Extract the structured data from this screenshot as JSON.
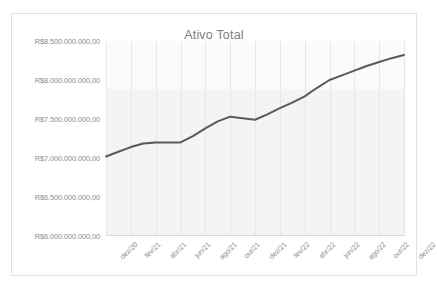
{
  "chart_data": {
    "type": "line",
    "title": "Ativo Total",
    "xlabel": "",
    "ylabel": "",
    "categories": [
      "dez/20",
      "jan/21",
      "fev/21",
      "mar/21",
      "abr/21",
      "mai/21",
      "jun/21",
      "jul/21",
      "ago/21",
      "set/21",
      "out/21",
      "nov/21",
      "dez/21",
      "jan/22",
      "fev/22",
      "mar/22",
      "abr/22",
      "mai/22",
      "jun/22",
      "jul/22",
      "ago/22",
      "set/22",
      "out/22",
      "nov/22",
      "dez/22"
    ],
    "tick_labels": [
      "dez/20",
      "fev/21",
      "abr/21",
      "jun/21",
      "ago/21",
      "out/21",
      "dez/21",
      "fev/22",
      "abr/22",
      "jun/22",
      "ago/22",
      "out/22",
      "dez/22"
    ],
    "values": [
      7020000000,
      7080000000,
      7140000000,
      7185000000,
      7200000000,
      7200000000,
      7200000000,
      7280000000,
      7380000000,
      7470000000,
      7530000000,
      7510000000,
      7490000000,
      7560000000,
      7640000000,
      7710000000,
      7790000000,
      7900000000,
      8000000000,
      8060000000,
      8120000000,
      8180000000,
      8230000000,
      8280000000,
      8320000000
    ],
    "ylim": [
      6000000000,
      8500000000
    ],
    "ytick_values": [
      6000000000,
      6500000000,
      7000000000,
      7500000000,
      8000000000,
      8500000000
    ],
    "ytick_labels": [
      "R$6.000.000.000,00",
      "R$6.500.000.000,00",
      "R$7.000.000.000,00",
      "R$7.500.000.000,00",
      "R$8.000.000.000,00",
      "R$8.500.000.000,00"
    ],
    "grid": {
      "vertical": true,
      "horizontal": false
    },
    "legend": {
      "visible": false,
      "position": "none"
    },
    "series_color": "#595959",
    "line_width": 2,
    "markers": false,
    "title_color": "#808080",
    "tick_label_color": "#8c8c8c",
    "plot_background_color": "#f2f2f2",
    "border_color": "#e2e2e2"
  }
}
